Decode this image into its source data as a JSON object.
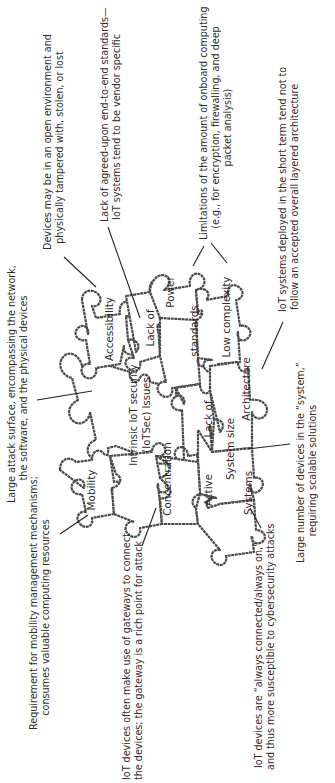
{
  "diagram": {
    "title_piece": {
      "line1": "Intrinsic IoT security",
      "line2": "(IoTSec) Issues"
    },
    "pieces": {
      "accessibility": "Accessibility",
      "lack_of_standards_1": "Lack of",
      "lack_of_standards_2": "standards",
      "power": "Power",
      "low_complexity": "Low complexity",
      "lack_of_architecture_1": "Lack of",
      "lack_of_architecture_2": "Architecture",
      "system_size": "System size",
      "mobility": "Mobility",
      "concentration": "Concentration",
      "active": "Active",
      "systems": "Systems"
    },
    "annotations": {
      "accessibility": {
        "line1": "Devices may be in an open environment and",
        "line2": "physically tampered with, stolen, or lost"
      },
      "lack_of_standards": {
        "line1": "Lack of agreed-upon end-to-end standards—",
        "line2": "IoT systems tend to be vendor specific"
      },
      "power_low_complexity": {
        "line1": "Limitations of the amount of onboard computing",
        "line2": "(e.g., for encryption, firewalling, and deep",
        "line3": "packet analysis)"
      },
      "architecture": {
        "line1": "IoT systems deployed in the short term tend not to",
        "line2": "follow an accepted overall layered architecture"
      },
      "attack_surface": {
        "line1": "Large attack surface, encompassing the network,",
        "line2": "the software, and the physical devices"
      },
      "mobility": {
        "line1": "Requirement for mobility management mechanisms;",
        "line2": "consumes valuable computing resources"
      },
      "concentration": {
        "line1": "IoT devices often make use of gateways to connect",
        "line2": "the devices; the gateway is a rich point for attack"
      },
      "active_systems": {
        "line1": "IoT devices are “always connected/always on,”",
        "line2": "and thus more susceptible to cybersecurity attacks"
      },
      "system_size": {
        "line1": "Large number of devices in the “system,”",
        "line2": "requiring scalable solutions"
      }
    },
    "colors": {
      "outline": "#4a4a4a",
      "text": "#2b2b2b",
      "background": "#ffffff"
    }
  }
}
